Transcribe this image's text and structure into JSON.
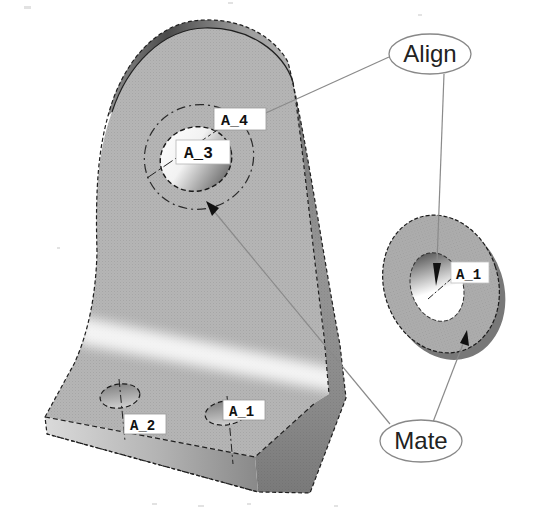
{
  "figure": {
    "callouts": {
      "align": "Align",
      "mate": "Mate"
    },
    "axis_tags": {
      "bracket_large_hole_upper": "A_4",
      "bracket_large_hole": "A_3",
      "bracket_base_left_hole": "A_2",
      "bracket_base_right_hole": "A_1",
      "washer_hole": "A_1"
    }
  },
  "colors": {
    "background": "#ffffff",
    "part_face": "#b5b5b5",
    "part_side": "#8a8a8a",
    "washer_face": "#adadad",
    "outline": "#1f1f1f",
    "leader": "#8a8a8a",
    "label_text": "#111111",
    "callout_border": "#888888"
  }
}
